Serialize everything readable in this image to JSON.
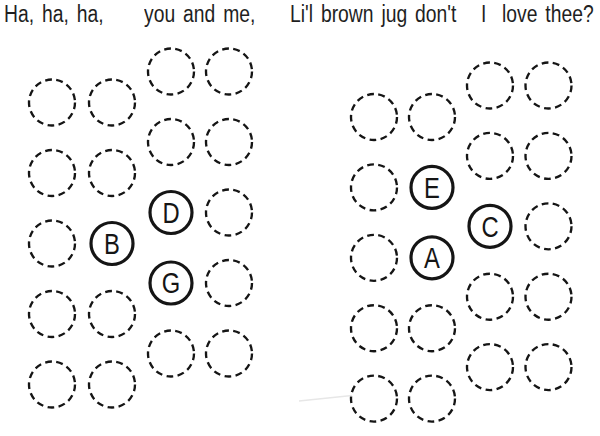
{
  "lyrics": {
    "segments": [
      {
        "text": "Ha, ha, ha,",
        "x": 4
      },
      {
        "text": "you and me,",
        "x": 144
      },
      {
        "text": "Li'l brown jug don't",
        "x": 290
      },
      {
        "text": "I",
        "x": 481
      },
      {
        "text": "love thee?",
        "x": 502
      }
    ]
  },
  "grids": [
    {
      "name": "left-grid",
      "origin_x": 52,
      "col_offsets": [
        0,
        60,
        119,
        177
      ],
      "row_base_front": 102.5,
      "row_base_back": 71.5,
      "row_step": 70.5,
      "cols": 4,
      "rows": 5,
      "labels": [
        {
          "letter": "B",
          "col": 1,
          "row": 2
        },
        {
          "letter": "D",
          "col": 2,
          "row": 2
        },
        {
          "letter": "G",
          "col": 2,
          "row": 3
        }
      ]
    },
    {
      "name": "right-grid",
      "origin_x": 374,
      "col_offsets": [
        0,
        58,
        116,
        174.5
      ],
      "row_base_front": 117,
      "row_base_back": 85.5,
      "row_step": 70.4,
      "cols": 4,
      "rows": 5,
      "labels": [
        {
          "letter": "E",
          "col": 1,
          "row": 1
        },
        {
          "letter": "A",
          "col": 1,
          "row": 2
        },
        {
          "letter": "C",
          "col": 2,
          "row": 2
        }
      ]
    }
  ],
  "style": {
    "background": "#ffffff",
    "text_ink": "#1f1f1f",
    "line_ink": "#151515",
    "artifact_line": "#e7e7e7"
  }
}
